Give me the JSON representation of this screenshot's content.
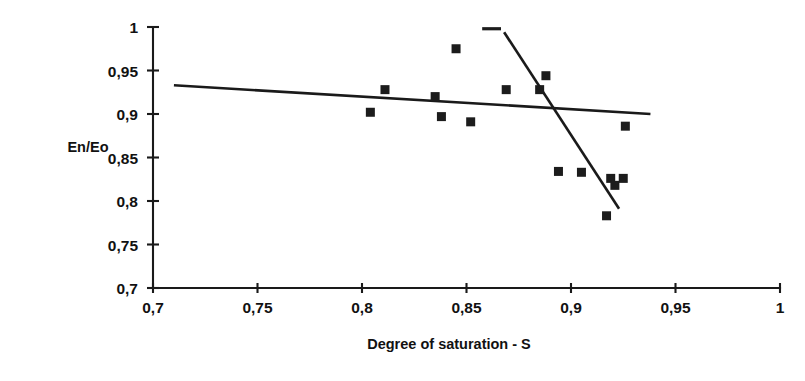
{
  "chart_data": {
    "type": "scatter",
    "title": "",
    "xlabel": "Degree of saturation - S",
    "ylabel": "En/Eo",
    "xlim": [
      0.7,
      1.0
    ],
    "ylim": [
      0.7,
      1.0
    ],
    "grid": false,
    "legend": "none",
    "x_ticks": [
      "0,7",
      "0,75",
      "0,8",
      "0,85",
      "0,9",
      "0,95",
      "1"
    ],
    "x_tick_values": [
      0.7,
      0.75,
      0.8,
      0.85,
      0.9,
      0.95,
      1.0
    ],
    "y_ticks": [
      "0,7",
      "0,75",
      "0,8",
      "0,85",
      "0,9",
      "0,95",
      "1"
    ],
    "y_tick_values": [
      0.7,
      0.75,
      0.8,
      0.85,
      0.9,
      0.95,
      1.0
    ],
    "marker_shape": "square",
    "marker_color": "#1c1c1c",
    "points": [
      {
        "x": 0.804,
        "y": 0.902
      },
      {
        "x": 0.811,
        "y": 0.928
      },
      {
        "x": 0.835,
        "y": 0.92
      },
      {
        "x": 0.838,
        "y": 0.897
      },
      {
        "x": 0.845,
        "y": 0.975
      },
      {
        "x": 0.852,
        "y": 0.891
      },
      {
        "x": 0.869,
        "y": 0.928
      },
      {
        "x": 0.885,
        "y": 0.928
      },
      {
        "x": 0.888,
        "y": 0.944
      },
      {
        "x": 0.894,
        "y": 0.834
      },
      {
        "x": 0.905,
        "y": 0.833
      },
      {
        "x": 0.917,
        "y": 0.783
      },
      {
        "x": 0.919,
        "y": 0.826
      },
      {
        "x": 0.921,
        "y": 0.818
      },
      {
        "x": 0.925,
        "y": 0.826
      },
      {
        "x": 0.926,
        "y": 0.886
      }
    ],
    "lines": [
      {
        "name": "shallow-regression-line",
        "x0": 0.71,
        "y0": 0.933,
        "x1": 0.938,
        "y1": 0.9
      },
      {
        "name": "steep-regression-line",
        "x0": 0.868,
        "y0": 0.994,
        "x1": 0.923,
        "y1": 0.791
      }
    ],
    "annotations": [
      {
        "name": "top-dash-mark",
        "type": "dash",
        "x": 0.862,
        "y": 0.998,
        "width": 0.009
      }
    ]
  }
}
